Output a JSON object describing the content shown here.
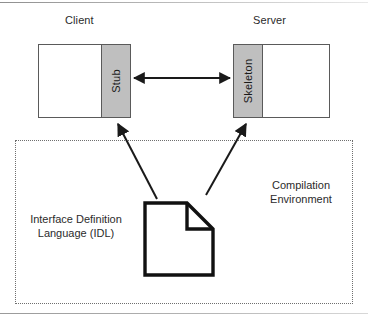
{
  "diagram": {
    "title_client": "Client",
    "title_server": "Server",
    "stub_label": "Stub",
    "skeleton_label": "Skeleton",
    "idl_label_line1": "Interface Definition",
    "idl_label_line2": "Language (IDL)",
    "compilation_label_line1": "Compilation",
    "compilation_label_line2": "Environment",
    "document_icon_name": "document-icon",
    "colors": {
      "band_fill": "#bfbfbf",
      "stroke": "#5a5a5a",
      "arrow": "#1a1a1a",
      "dotted_border": "#6f6f6f",
      "text": "#2b2b2b",
      "background": "#ffffff"
    },
    "connectors": [
      {
        "name": "stub-skeleton-bidirectional-arrow",
        "from": "Stub",
        "to": "Skeleton",
        "style": "double-headed"
      },
      {
        "name": "idl-to-stub-arrow",
        "from": "Interface Definition Language (IDL)",
        "to": "Stub",
        "style": "single-headed"
      },
      {
        "name": "idl-to-skeleton-arrow",
        "from": "Interface Definition Language (IDL)",
        "to": "Skeleton",
        "style": "single-headed"
      }
    ]
  }
}
